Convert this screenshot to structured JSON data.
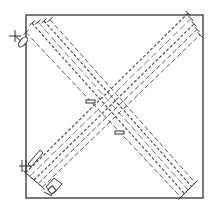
{
  "diagram": {
    "title": "",
    "colors": {
      "line": "#333333",
      "background": "#ffffff"
    },
    "bundles": [
      {
        "name": "descending-diagonal",
        "direction": "top-left to bottom-right",
        "line_count": 5
      },
      {
        "name": "ascending-diagonal",
        "direction": "bottom-left to top-right",
        "line_count": 5
      }
    ],
    "symbols": [
      {
        "name": "crosshair-marker",
        "location": "top-left outside frame"
      },
      {
        "name": "oval-marker",
        "location": "top-left frame edge"
      },
      {
        "name": "pen-marker",
        "location": "bottom-left frame edge"
      },
      {
        "name": "box-marker",
        "location": "bottom-left near floor"
      },
      {
        "name": "arrow-marker-left",
        "location": "center-left"
      },
      {
        "name": "arrow-marker-right",
        "location": "center-right-lower"
      }
    ]
  }
}
